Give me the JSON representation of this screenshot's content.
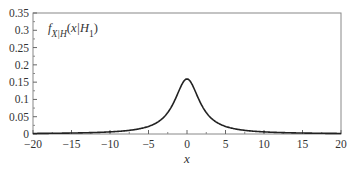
{
  "chart_data": {
    "type": "line",
    "title": "",
    "xlabel": "x",
    "ylabel": "",
    "xlim": [
      -20,
      20
    ],
    "ylim": [
      0,
      0.35
    ],
    "grid": false,
    "legend_position": "upper-left inside",
    "xticks": [
      -20,
      -15,
      -10,
      -5,
      0,
      5,
      10,
      15,
      20
    ],
    "xtick_labels": [
      "−20",
      "−15",
      "−10",
      "−5",
      "0",
      "5",
      "10",
      "15",
      "20"
    ],
    "yticks": [
      0,
      0.05,
      0.1,
      0.15,
      0.2,
      0.25,
      0.3,
      0.35
    ],
    "ytick_labels": [
      "0",
      "0.05",
      "0.1",
      "0.15",
      "0.2",
      "0.25",
      "0.3",
      "0.35"
    ],
    "annotation": "f_X|H(x|H1)",
    "series": [
      {
        "name": "f_X|H(x|H1)",
        "x": [
          -20,
          -15,
          -10,
          -7.5,
          -5,
          -4,
          -3,
          -2,
          -1.5,
          -1,
          -0.5,
          0,
          0.5,
          1,
          1.5,
          2,
          3,
          4,
          5,
          7.5,
          10,
          15,
          20
        ],
        "values": [
          0.0016,
          0.0028,
          0.0061,
          0.0106,
          0.022,
          0.0318,
          0.049,
          0.0796,
          0.1019,
          0.1273,
          0.1498,
          0.1592,
          0.1498,
          0.1273,
          0.1019,
          0.0796,
          0.049,
          0.0318,
          0.022,
          0.0106,
          0.0061,
          0.0028,
          0.0016
        ]
      }
    ]
  }
}
